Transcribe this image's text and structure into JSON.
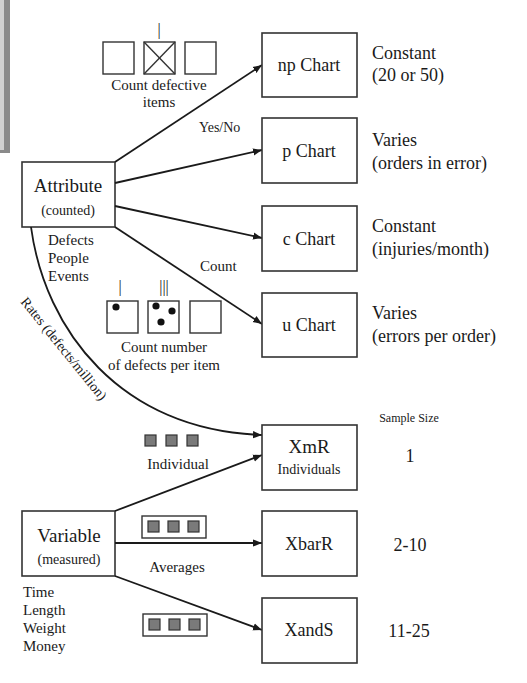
{
  "diagram": {
    "attribute": {
      "title": "Attribute",
      "subtitle": "(counted)",
      "examples": [
        "Defects",
        "People",
        "Events"
      ]
    },
    "variable": {
      "title": "Variable",
      "subtitle": "(measured)",
      "examples": [
        "Time",
        "Length",
        "Weight",
        "Money"
      ]
    },
    "charts": [
      {
        "name": "np Chart",
        "note_line1": "Constant",
        "note_line2": "(20 or 50)"
      },
      {
        "name": "p Chart",
        "note_line1": "Varies",
        "note_line2": "(orders in error)"
      },
      {
        "name": "c Chart",
        "note_line1": "Constant",
        "note_line2": "(injuries/month)"
      },
      {
        "name": "u Chart",
        "note_line1": "Varies",
        "note_line2": "(errors per order)"
      },
      {
        "name": "XmR",
        "subname": "Individuals",
        "sample_size": "1"
      },
      {
        "name": "XbarR",
        "sample_size": "2-10"
      },
      {
        "name": "XandS",
        "sample_size": "11-25"
      }
    ],
    "labels": {
      "count_defective_line1": "Count defective",
      "count_defective_line2": "items",
      "yes_no": "Yes/No",
      "count": "Count",
      "count_number_line1": "Count number",
      "count_number_line2": "of defects per item",
      "rates": "Rates (defects/million)",
      "individual": "Individual",
      "averages": "Averages",
      "sample_size_header": "Sample Size",
      "tally_one": "|",
      "tally_three": "|||"
    }
  }
}
